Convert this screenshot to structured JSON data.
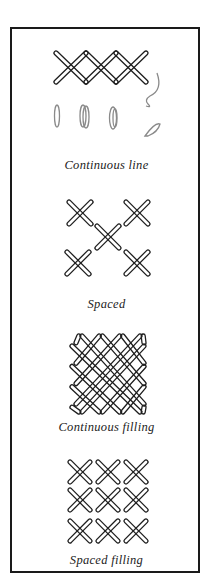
{
  "figure": {
    "sections": [
      {
        "id": "continuous-line",
        "caption": "Continuous line"
      },
      {
        "id": "spaced",
        "caption": "Spaced"
      },
      {
        "id": "continuous-filling",
        "caption": "Continuous filling"
      },
      {
        "id": "spaced-filling",
        "caption": "Spaced filling"
      }
    ]
  }
}
